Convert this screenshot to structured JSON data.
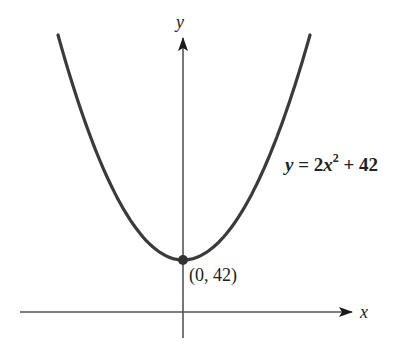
{
  "chart_data": {
    "type": "line",
    "title": "",
    "xlabel": "x",
    "ylabel": "y",
    "series": [
      {
        "name": "y = 2x^2 + 42",
        "function": "y = 2x^2 + 42",
        "x": [
          -4,
          -3,
          -2,
          -1,
          0,
          1,
          2,
          3,
          4
        ],
        "values": [
          74,
          60,
          50,
          44,
          42,
          44,
          50,
          60,
          74
        ]
      }
    ],
    "annotations": [
      {
        "label": "(0, 42)",
        "x": 0,
        "y": 42,
        "marker": "filled-circle"
      },
      {
        "label": "y = 2x² + 42",
        "position": "right of curve"
      }
    ],
    "grid": false,
    "ticks": "none",
    "legend": "none"
  },
  "labels": {
    "y_axis": "y",
    "x_axis": "x",
    "equation_y": "y",
    "equation_mid": " = 2",
    "equation_x": "x",
    "equation_exp": "2",
    "equation_tail": " + 42",
    "vertex": "(0, 42)"
  },
  "colors": {
    "curve": "#3a3a3a",
    "axes": "#555555",
    "text": "#222222",
    "background": "#ffffff"
  }
}
